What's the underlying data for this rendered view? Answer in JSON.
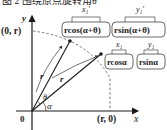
{
  "figure": {
    "title": "图 2  围绕原点旋转角θ",
    "axes": {
      "x_label": "x",
      "y_label": "y",
      "origin_label": "0"
    },
    "points": {
      "y_intercept": "(0, r)",
      "x_intercept": "(r, 0)"
    },
    "radius_label": "r",
    "angles": {
      "alpha": "α",
      "theta": "θ"
    },
    "rotated_point": {
      "x_expr": "rcos(α+θ)",
      "y_expr": "rsin(α+θ)",
      "x_tag": "x₁′",
      "y_tag": "y₁′"
    },
    "original_point": {
      "x_expr": "rcosα",
      "y_expr": "rsinα",
      "x_tag": "x₁",
      "y_tag": "y₁"
    }
  }
}
